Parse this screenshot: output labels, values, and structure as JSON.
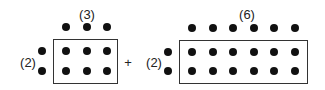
{
  "left_array": {
    "top_label": "(3)",
    "side_label": "(2)",
    "columns": 3,
    "rows": 2
  },
  "operator": "+",
  "right_array": {
    "top_label": "(6)",
    "side_label": "(2)",
    "columns": 6,
    "rows": 2
  },
  "colors": {
    "dot": "#111111",
    "box": "#333333"
  }
}
